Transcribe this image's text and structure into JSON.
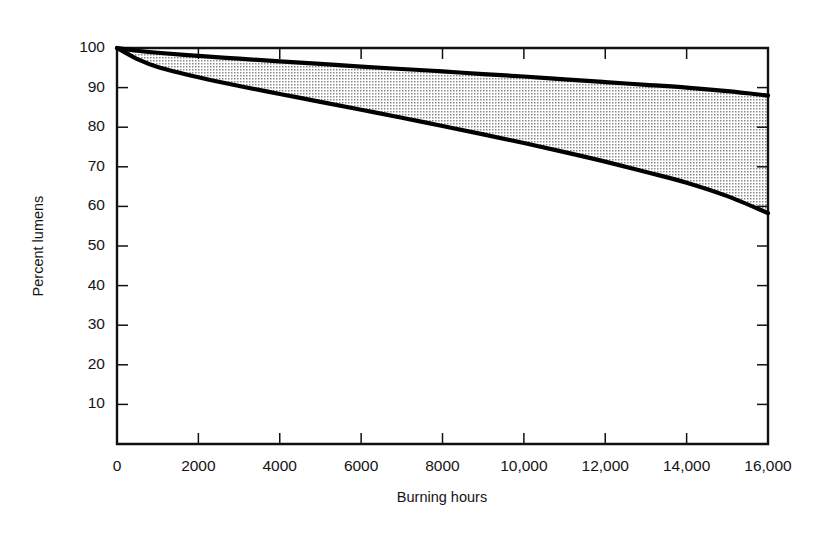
{
  "chart_data": {
    "type": "area",
    "title": "",
    "subtitle": "",
    "xlabel": "Burning hours",
    "ylabel": "Percent lumens",
    "xlim": [
      0,
      16000
    ],
    "ylim": [
      0,
      100
    ],
    "grid": false,
    "legend_position": "none",
    "x_tick_labels": [
      "0",
      "2000",
      "4000",
      "6000",
      "8000",
      "10,000",
      "12,000",
      "14,000",
      "16,000"
    ],
    "x_tick_values": [
      0,
      2000,
      4000,
      6000,
      8000,
      10000,
      12000,
      14000,
      16000
    ],
    "y_tick_labels": [
      "100",
      "90",
      "80",
      "70",
      "60",
      "50",
      "40",
      "30",
      "20",
      "10"
    ],
    "y_tick_values": [
      100,
      90,
      80,
      70,
      60,
      50,
      40,
      30,
      20,
      10
    ],
    "y_origin_label": "0",
    "shaded_band": {
      "name": "Lumen maintenance range",
      "fill_style": "dot-stipple",
      "fill_color": "#cfcfcf"
    },
    "x": [
      0,
      500,
      1000,
      2000,
      3000,
      4000,
      5000,
      6000,
      7000,
      8000,
      9000,
      10000,
      11000,
      12000,
      13000,
      14000,
      15000,
      16000
    ],
    "series": [
      {
        "name": "Upper curve",
        "values": [
          100,
          99.3,
          98.8,
          98.0,
          97.3,
          96.6,
          96.0,
          95.3,
          94.7,
          94.1,
          93.4,
          92.8,
          92.1,
          91.4,
          90.7,
          90.0,
          89.1,
          88.0
        ]
      },
      {
        "name": "Lower curve",
        "values": [
          100,
          97.2,
          95.2,
          92.6,
          90.4,
          88.4,
          86.4,
          84.4,
          82.4,
          80.3,
          78.2,
          76.0,
          73.7,
          71.3,
          68.7,
          66.0,
          62.6,
          58.3
        ]
      }
    ]
  },
  "figure": {
    "xaxis_title": "Burning hours",
    "yaxis_title": "Percent lumens"
  }
}
